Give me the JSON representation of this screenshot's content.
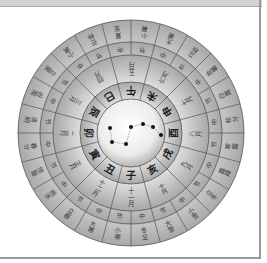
{
  "diagram": {
    "center": {
      "x": 131,
      "y": 133
    },
    "radii": {
      "outer": 113,
      "terms_inner": 91,
      "zhongjie_inner": 78,
      "months_inner": 51,
      "branches_inner": 34
    },
    "colors": {
      "ring_light": "#f4f4f4",
      "ring_dark": "#9c9c9c",
      "stroke": "#555555",
      "dot": "#111111"
    },
    "branches": [
      "午",
      "巳",
      "辰",
      "卯",
      "寅",
      "丑",
      "子",
      "亥",
      "戌",
      "酉",
      "申",
      "未"
    ],
    "months": [
      "五月",
      "四月",
      "三月",
      "二月",
      "正月",
      "十二月",
      "十一月",
      "十月",
      "九月",
      "八月",
      "七月",
      "六月"
    ],
    "zhongjie": [
      "中",
      "节",
      "中",
      "节",
      "中",
      "节",
      "中",
      "节",
      "中",
      "节",
      "中",
      "节",
      "中",
      "节",
      "中",
      "节",
      "中",
      "节",
      "中",
      "节",
      "中",
      "节",
      "中",
      "节"
    ],
    "solar_terms": [
      "夏至",
      "芒种",
      "小满",
      "立夏",
      "谷雨",
      "清明",
      "春分",
      "惊蛰",
      "雨水",
      "立春",
      "大寒",
      "小寒",
      "冬至",
      "大雪",
      "小雪",
      "立冬",
      "霜降",
      "寒露",
      "秋分",
      "白露",
      "处暑",
      "立秋",
      "大暑",
      "小暑"
    ],
    "big_dipper": {
      "stars": [
        [
          110,
          128
        ],
        [
          131,
          127
        ],
        [
          143,
          124
        ],
        [
          153,
          127
        ],
        [
          161,
          135
        ],
        [
          112,
          142
        ],
        [
          126,
          144
        ]
      ],
      "links": [
        [
          0,
          5
        ],
        [
          5,
          6
        ],
        [
          6,
          1
        ],
        [
          1,
          2
        ],
        [
          2,
          3
        ],
        [
          3,
          4
        ]
      ]
    }
  }
}
